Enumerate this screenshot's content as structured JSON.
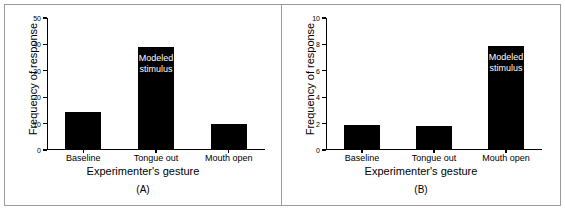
{
  "figure": {
    "background_color": "#ffffff",
    "border_color": "#9a9a9a",
    "bar_color": "#000000",
    "annotation_color": "#ffffff"
  },
  "chart_data": [
    {
      "type": "bar",
      "panel_tag": "(A)",
      "title": "",
      "xlabel": "Experimenter's gesture",
      "ylabel": "Frequency of response",
      "categories": [
        "Baseline",
        "Tongue out",
        "Mouth open"
      ],
      "values": [
        14.5,
        39,
        10
      ],
      "ylim": [
        0,
        50
      ],
      "yticks": [
        0,
        10,
        20,
        30,
        40,
        50
      ],
      "ytick_labels": [
        "0",
        "10",
        "20",
        "30",
        "40",
        "50"
      ],
      "grid": false,
      "legend": "none",
      "annotations": [
        {
          "text_line1": "Modeled",
          "text_line2": "stimulus",
          "on_category": "Tongue out",
          "color": "#ffffff"
        }
      ]
    },
    {
      "type": "bar",
      "panel_tag": "(B)",
      "title": "",
      "xlabel": "Experimenter's gesture",
      "ylabel": "Frequency of response",
      "categories": [
        "Baseline",
        "Tongue out",
        "Mouth open"
      ],
      "values": [
        1.9,
        1.85,
        7.9
      ],
      "ylim": [
        0,
        10
      ],
      "yticks": [
        0,
        2,
        4,
        6,
        8,
        10
      ],
      "ytick_labels": [
        "0",
        "2",
        "4",
        "6",
        "8",
        "10"
      ],
      "grid": false,
      "legend": "none",
      "annotations": [
        {
          "text_line1": "Modeled",
          "text_line2": "stimulus",
          "on_category": "Mouth open",
          "color": "#ffffff"
        }
      ]
    }
  ]
}
